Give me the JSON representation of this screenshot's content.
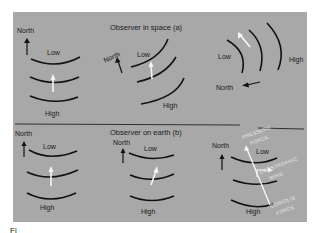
{
  "figure": {
    "background_color": "#a8a8a8",
    "panel_a": {
      "title": "Observer in space (a)",
      "diagrams": [
        {
          "north": "North",
          "low": "Low",
          "high": "High"
        },
        {
          "north": "North",
          "low": "Low",
          "high": "High"
        },
        {
          "north": "North",
          "low": "Low",
          "high": "High"
        }
      ]
    },
    "panel_b": {
      "title": "Observer on earth (b)",
      "diagrams": [
        {
          "north": "North",
          "low": "Low",
          "high": "High"
        },
        {
          "north": "North",
          "low": "Low",
          "high": "High"
        },
        {
          "north": "North",
          "low": "Low",
          "high": "High",
          "force_labels": {
            "pressure_1": "PRESSURE",
            "pressure_2": "FORCE",
            "wind_1": "GEOSTROPHIC",
            "wind_2": "WIND",
            "coriolis_1": "CORIOLIS",
            "coriolis_2": "FORCE"
          }
        }
      ]
    },
    "caption": "Fi"
  }
}
